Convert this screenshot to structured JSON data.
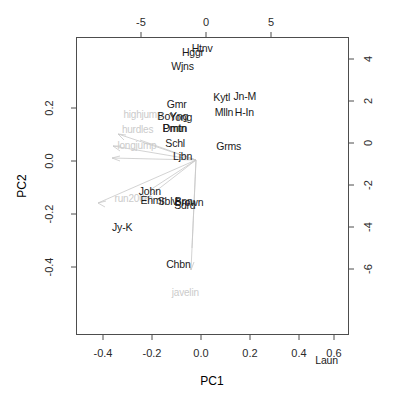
{
  "chart_data": {
    "type": "scatter",
    "subtype": "pca-biplot",
    "title": "",
    "xlabel": "PC1",
    "ylabel": "PC2",
    "xlim": [
      -0.5,
      0.68
    ],
    "ylim": [
      -0.52,
      0.33
    ],
    "grid": false,
    "legend": null,
    "axes": {
      "bottom": {
        "label": "PC1",
        "ticks": [
          "-0.4",
          "-0.2",
          "0.0",
          "0.2",
          "0.4",
          "0.6"
        ],
        "values": [
          -0.4,
          -0.2,
          0.0,
          0.2,
          0.4,
          0.6
        ]
      },
      "left": {
        "label": "PC2",
        "ticks": [
          "0.2",
          "0.0",
          "-0.2",
          "-0.4"
        ],
        "values": [
          0.2,
          0.0,
          -0.2,
          -0.4
        ]
      },
      "top": {
        "label": "",
        "ticks": [
          "-5",
          "0",
          "5"
        ],
        "values": [
          -5,
          0,
          5
        ]
      },
      "right": {
        "label": "",
        "ticks": [
          "4",
          "2",
          "0",
          "-2",
          "-4",
          "-6"
        ],
        "values": [
          4,
          2,
          0,
          -2,
          -4,
          -6
        ]
      }
    },
    "observations": [
      {
        "label": "Htnv",
        "x": 0.045,
        "y": 0.3
      },
      {
        "label": "Hggr",
        "x": 0.005,
        "y": 0.288
      },
      {
        "label": "Wjns",
        "x": -0.04,
        "y": 0.248
      },
      {
        "label": "Kytl",
        "x": 0.13,
        "y": 0.16
      },
      {
        "label": "Jn-M",
        "x": 0.23,
        "y": 0.162
      },
      {
        "label": "Gmr",
        "x": -0.065,
        "y": 0.14
      },
      {
        "label": "Mlln",
        "x": 0.14,
        "y": 0.118
      },
      {
        "label": "H-In",
        "x": 0.228,
        "y": 0.118
      },
      {
        "label": "BoYng",
        "x": -0.082,
        "y": 0.105
      },
      {
        "label": "Yong",
        "x": -0.048,
        "y": 0.103
      },
      {
        "label": "Pmtn",
        "x": -0.075,
        "y": 0.072
      },
      {
        "label": "Dmtn",
        "x": -0.073,
        "y": 0.07
      },
      {
        "label": "Schl",
        "x": -0.072,
        "y": 0.028
      },
      {
        "label": "Grms",
        "x": 0.16,
        "y": 0.02
      },
      {
        "label": "Ljbn",
        "x": -0.04,
        "y": -0.008
      },
      {
        "label": "John",
        "x": -0.182,
        "y": -0.108
      },
      {
        "label": "Ehmr",
        "x": -0.17,
        "y": -0.135
      },
      {
        "label": "Sblv",
        "x": -0.105,
        "y": -0.138
      },
      {
        "label": "Bnn",
        "x": -0.035,
        "y": -0.138
      },
      {
        "label": "Brown",
        "x": -0.012,
        "y": -0.14
      },
      {
        "label": "Sdrd",
        "x": -0.03,
        "y": -0.15
      },
      {
        "label": "Jy-K",
        "x": -0.302,
        "y": -0.212
      },
      {
        "label": "Chbn",
        "x": -0.058,
        "y": -0.318
      },
      {
        "label": "Laun",
        "x": 0.585,
        "y": -0.592
      }
    ],
    "variables": [
      {
        "label": "highjump",
        "x": -0.212,
        "y": 0.11,
        "arrow_x": -0.165,
        "arrow_y": 0.095
      },
      {
        "label": "hurdles",
        "x": -0.235,
        "y": 0.068,
        "arrow_x": -0.17,
        "arrow_y": 0.062
      },
      {
        "label": "longjump",
        "x": -0.238,
        "y": 0.022,
        "arrow_x": -0.172,
        "arrow_y": 0.03
      },
      {
        "label": "run200m",
        "x": -0.252,
        "y": -0.128,
        "arrow_x": -0.208,
        "arrow_y": -0.126
      },
      {
        "label": "javelin",
        "x": -0.028,
        "y": -0.398,
        "arrow_x": -0.022,
        "arrow_y": -0.345
      }
    ],
    "arrow_origin": {
      "x": -0.02,
      "y": 0.05
    }
  }
}
